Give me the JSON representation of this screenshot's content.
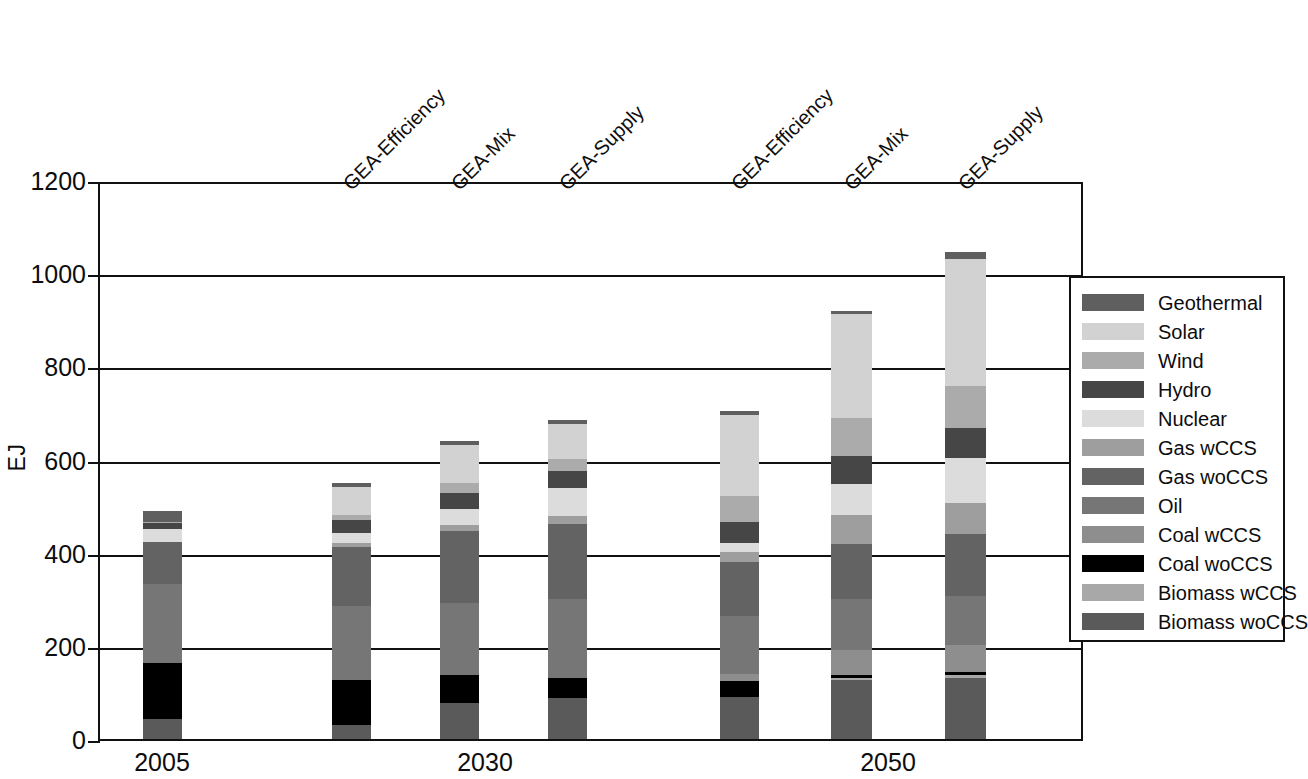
{
  "chart_data": {
    "type": "bar",
    "stacked": true,
    "title": "",
    "subtitle": "",
    "xlabel": "",
    "ylabel": "EJ",
    "ylim": [
      0,
      1200
    ],
    "yticks": [
      0,
      200,
      400,
      600,
      800,
      1000,
      1200
    ],
    "ytick_labels": [
      "0",
      "200",
      "400",
      "600",
      "800",
      "1000",
      "1200"
    ],
    "grid": true,
    "legend_position": "right",
    "groups": [
      {
        "label": "2005",
        "bars": [
          0
        ]
      },
      {
        "label": "2030",
        "bars": [
          1,
          2,
          3
        ]
      },
      {
        "label": "2050",
        "bars": [
          4,
          5,
          6
        ]
      }
    ],
    "categories": [
      "2005",
      "GEA-Efficiency",
      "GEA-Mix",
      "GEA-Supply",
      "GEA-Efficiency",
      "GEA-Mix",
      "GEA-Supply"
    ],
    "scenario_labels": [
      "GEA-Efficiency",
      "GEA-Mix",
      "GEA-Supply",
      "GEA-Efficiency",
      "GEA-Mix",
      "GEA-Supply"
    ],
    "series": [
      {
        "name": "Biomass woCCS",
        "color": "#5a5a5a",
        "values": [
          44,
          30,
          78,
          87,
          90,
          126,
          131
        ]
      },
      {
        "name": "Biomass wCCS",
        "color": "#a8a8a8",
        "values": [
          0,
          0,
          0,
          0,
          0,
          5,
          6
        ]
      },
      {
        "name": "Coal woCCS",
        "color": "#000000",
        "values": [
          120,
          96,
          60,
          45,
          34,
          6,
          6
        ]
      },
      {
        "name": "Coal wCCS",
        "color": "#8e8e8e",
        "values": [
          0,
          0,
          0,
          0,
          15,
          54,
          58
        ]
      },
      {
        "name": "Oil",
        "color": "#767676",
        "values": [
          168,
          160,
          155,
          168,
          126,
          110,
          106
        ]
      },
      {
        "name": "Gas woCCS",
        "color": "#636363",
        "values": [
          92,
          126,
          154,
          162,
          115,
          118,
          133
        ]
      },
      {
        "name": "Gas wCCS",
        "color": "#9e9e9e",
        "values": [
          0,
          8,
          12,
          16,
          22,
          63,
          66
        ]
      },
      {
        "name": "Nuclear",
        "color": "#dcdcdc",
        "values": [
          28,
          22,
          35,
          60,
          18,
          66,
          98
        ]
      },
      {
        "name": "Hydro",
        "color": "#464646",
        "values": [
          11,
          28,
          35,
          38,
          47,
          60,
          63
        ]
      },
      {
        "name": "Wind",
        "color": "#ababab",
        "values": [
          2,
          12,
          20,
          26,
          54,
          82,
          90
        ]
      },
      {
        "name": "Solar",
        "color": "#d2d2d2",
        "values": [
          1,
          60,
          82,
          74,
          174,
          222,
          274
        ]
      },
      {
        "name": "Geothermal",
        "color": "#5f5f5f",
        "values": [
          23,
          8,
          9,
          9,
          9,
          8,
          14
        ]
      }
    ],
    "totals": [
      489,
      550,
      640,
      685,
      704,
      920,
      1045
    ]
  },
  "legend": {
    "items": [
      {
        "label": "Geothermal",
        "color": "#5f5f5f"
      },
      {
        "label": "Solar",
        "color": "#d2d2d2"
      },
      {
        "label": "Wind",
        "color": "#ababab"
      },
      {
        "label": "Hydro",
        "color": "#464646"
      },
      {
        "label": "Nuclear",
        "color": "#dcdcdc"
      },
      {
        "label": "Gas wCCS",
        "color": "#9e9e9e"
      },
      {
        "label": "Gas woCCS",
        "color": "#636363"
      },
      {
        "label": "Oil",
        "color": "#767676"
      },
      {
        "label": "Coal wCCS",
        "color": "#8e8e8e"
      },
      {
        "label": "Coal woCCS",
        "color": "#000000"
      },
      {
        "label": "Biomass wCCS",
        "color": "#a8a8a8"
      },
      {
        "label": "Biomass woCCS",
        "color": "#5a5a5a"
      }
    ]
  },
  "axis": {
    "y_title": "EJ"
  }
}
